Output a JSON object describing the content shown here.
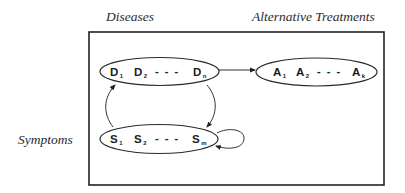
{
  "diagram": {
    "colors": {
      "stroke": "#2a2a2a",
      "text": "#1c1c1c",
      "background": "#ffffff"
    },
    "labels": {
      "diseases": "Diseases",
      "treatments": "Alternative Treatments",
      "symptoms": "Symptoms"
    },
    "nodes": {
      "diseases": {
        "items": [
          {
            "base": "D",
            "sub": "1"
          },
          {
            "base": "D",
            "sub": "2"
          },
          {
            "base": "D",
            "sub": "n"
          }
        ],
        "ellipsis": "- - -"
      },
      "treatments": {
        "items": [
          {
            "base": "A",
            "sub": "1"
          },
          {
            "base": "A",
            "sub": "2"
          },
          {
            "base": "A",
            "sub": "k"
          }
        ],
        "ellipsis": "- - -"
      },
      "symptoms": {
        "items": [
          {
            "base": "S",
            "sub": "1"
          },
          {
            "base": "S",
            "sub": "2"
          },
          {
            "base": "S",
            "sub": "m"
          }
        ],
        "ellipsis": "- - -"
      }
    },
    "edges": [
      {
        "from": "diseases",
        "to": "treatments",
        "type": "straight-arrow"
      },
      {
        "from": "diseases",
        "to": "symptoms",
        "type": "curved-arrow"
      },
      {
        "from": "symptoms",
        "to": "diseases",
        "type": "curved-arrow"
      },
      {
        "from": "symptoms",
        "to": "symptoms",
        "type": "self-loop"
      }
    ]
  }
}
